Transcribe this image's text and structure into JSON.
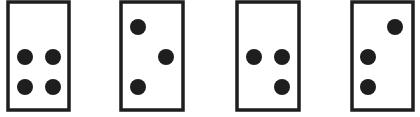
{
  "figure": {
    "colors": {
      "stroke": "#1e1e1e",
      "dot": "#1e1e1e",
      "card_fill": "#ffffff",
      "background": "#ffffff"
    },
    "grid": {
      "columns": 2,
      "rows": 3
    },
    "cards": [
      {
        "label": "card-1",
        "dot_count": 4,
        "dots": [
          {
            "col": 0,
            "row": 1
          },
          {
            "col": 1,
            "row": 1
          },
          {
            "col": 0,
            "row": 2
          },
          {
            "col": 1,
            "row": 2
          }
        ]
      },
      {
        "label": "card-2",
        "dot_count": 3,
        "dots": [
          {
            "col": 0,
            "row": 0
          },
          {
            "col": 1,
            "row": 1
          },
          {
            "col": 0,
            "row": 2
          }
        ]
      },
      {
        "label": "card-3",
        "dot_count": 3,
        "dots": [
          {
            "col": 0,
            "row": 1
          },
          {
            "col": 1,
            "row": 1
          },
          {
            "col": 1,
            "row": 2
          }
        ]
      },
      {
        "label": "card-4",
        "dot_count": 3,
        "dots": [
          {
            "col": 1,
            "row": 0
          },
          {
            "col": 0,
            "row": 1
          },
          {
            "col": 0,
            "row": 2
          }
        ]
      }
    ]
  }
}
